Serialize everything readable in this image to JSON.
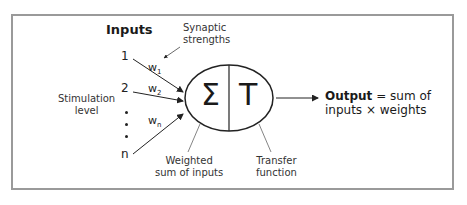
{
  "diagram": {
    "inputs_title": "Inputs",
    "synaptic_label_line1": "Synaptic",
    "synaptic_label_line2": "strengths",
    "stimulation_label_line1": "Stimulation",
    "stimulation_label_line2": "level",
    "input_numbers": [
      "1",
      "2",
      "n"
    ],
    "weights": [
      {
        "base": "w",
        "sub": "1"
      },
      {
        "base": "w",
        "sub": "2"
      },
      {
        "base": "w",
        "sub": "n"
      }
    ],
    "sum_symbol": "Σ",
    "transfer_symbol": "T",
    "weighted_label_line1": "Weighted",
    "weighted_label_line2": "sum of inputs",
    "transfer_label_line1": "Transfer",
    "transfer_label_line2": "function",
    "output_bold": "Output",
    "output_rest_line1": " = sum of",
    "output_line2": "inputs × weights"
  },
  "colors": {
    "frame_border": "#9a9a9a",
    "ink": "#1a1a1a"
  }
}
